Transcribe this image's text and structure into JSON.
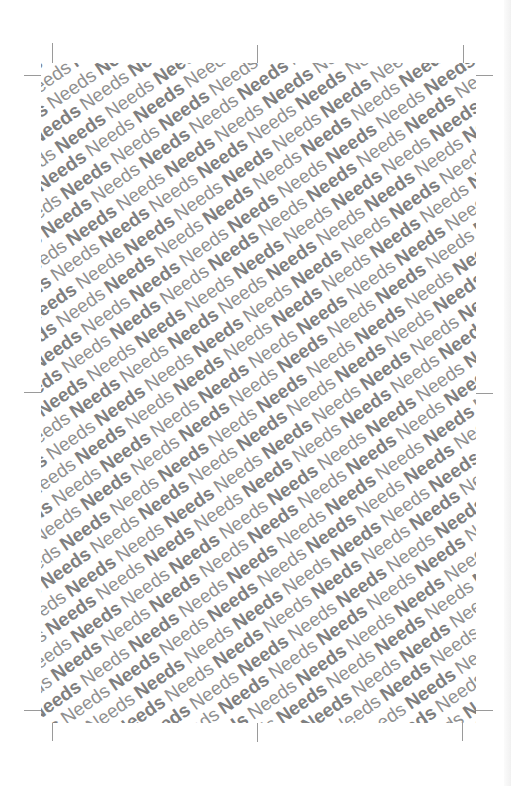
{
  "pattern": {
    "word": "Needs",
    "styles": [
      "bold",
      "regular"
    ],
    "angle_deg": -35,
    "text_color": "#8a8a8a",
    "background": "#ffffff"
  },
  "crop_marks": [
    {
      "name": "top-left-vertical"
    },
    {
      "name": "top-left-horizontal"
    },
    {
      "name": "top-center"
    },
    {
      "name": "top-right-vertical"
    },
    {
      "name": "top-right-horizontal"
    },
    {
      "name": "middle-left"
    },
    {
      "name": "middle-right"
    },
    {
      "name": "bottom-left-vertical"
    },
    {
      "name": "bottom-left-horizontal"
    },
    {
      "name": "bottom-center"
    },
    {
      "name": "bottom-right-vertical"
    },
    {
      "name": "bottom-right-horizontal"
    }
  ]
}
